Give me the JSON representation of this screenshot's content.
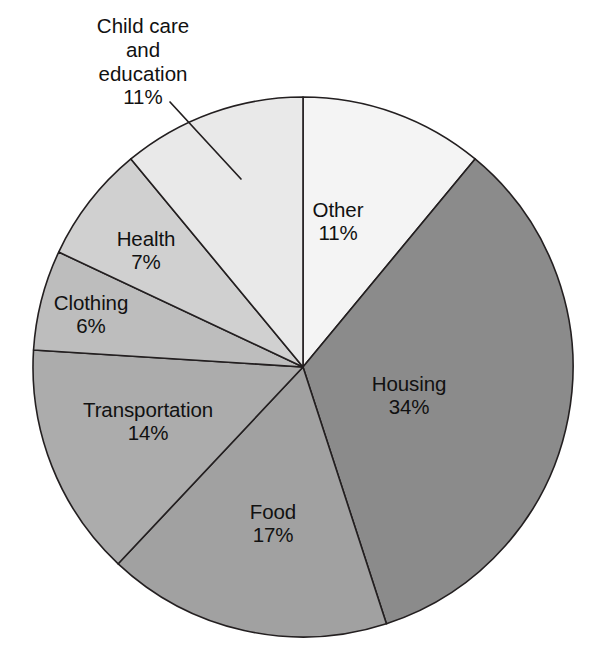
{
  "chart_data": {
    "type": "pie",
    "title": "",
    "subtitle": "",
    "xlabel": "",
    "ylabel": "",
    "units": "percent",
    "legend_position": "none",
    "grid": false,
    "labels_on_slices": true,
    "categories": [
      "Other",
      "Housing",
      "Food",
      "Transportation",
      "Clothing",
      "Health",
      "Child care and education"
    ],
    "values": [
      11,
      34,
      17,
      14,
      6,
      7,
      11
    ],
    "value_labels": [
      "11%",
      "34%",
      "17%",
      "14%",
      "6%",
      "7%",
      "11%"
    ],
    "start_angle_deg": 0,
    "direction": "clockwise",
    "slices": [
      {
        "name": "Other",
        "value": 11,
        "value_label": "11%",
        "color": "#f4f4f4",
        "label_placement": "inside",
        "label_x": 338,
        "label_y": 198
      },
      {
        "name": "Housing",
        "value": 34,
        "value_label": "34%",
        "color": "#8b8b8b",
        "label_placement": "inside",
        "label_x": 409,
        "label_y": 372
      },
      {
        "name": "Food",
        "value": 17,
        "value_label": "17%",
        "color": "#a1a1a1",
        "label_placement": "inside",
        "label_x": 237,
        "label_y": 500
      },
      {
        "name": "Transportation",
        "value": 14,
        "value_label": "14%",
        "color": "#acacac",
        "label_placement": "inside",
        "label_x": 72,
        "label_y": 398
      },
      {
        "name": "Clothing",
        "value": 6,
        "value_label": "6%",
        "color": "#bdbdbd",
        "label_placement": "inside",
        "label_x": 40,
        "label_y": 291
      },
      {
        "name": "Health",
        "value": 7,
        "value_label": "7%",
        "color": "#d0d0d0",
        "label_placement": "inside",
        "label_x": 107,
        "label_y": 227
      },
      {
        "name": "Child care and education",
        "value": 11,
        "value_label": "11%",
        "color": "#e9e9e9",
        "label_placement": "callout",
        "label_x": 86,
        "label_y": 14,
        "leader": {
          "x1": 170,
          "y1": 102,
          "x2": 241,
          "y2": 179
        }
      }
    ],
    "geometry": {
      "cx": 303,
      "cy": 367,
      "r": 270
    },
    "stroke_color": "#231f20",
    "background": "#ffffff"
  },
  "labels": {
    "other": {
      "name": "Other",
      "value": "11%"
    },
    "housing": {
      "name": "Housing",
      "value": "34%"
    },
    "food": {
      "name": "Food",
      "value": "17%"
    },
    "transportation": {
      "name": "Transportation",
      "value": "14%"
    },
    "clothing": {
      "name": "Clothing",
      "value": "6%"
    },
    "health": {
      "name": "Health",
      "value": "7%"
    },
    "childcare": {
      "line1": "Child care",
      "line2": "and",
      "line3": "education",
      "value": "11%"
    }
  }
}
